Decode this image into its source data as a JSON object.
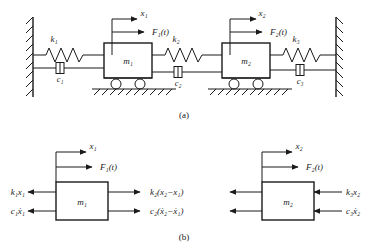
{
  "figure": {
    "title_a": "(a)",
    "title_b": "(b)",
    "stroke_color": "#1a1a1a",
    "mass_fill": "#ffffff",
    "background": "#ffffff"
  },
  "system": {
    "masses": [
      {
        "label": "m₁",
        "displacement": "x₁",
        "force": "F₁(t)"
      },
      {
        "label": "m₂",
        "displacement": "x₂",
        "force": "F₂(t)"
      }
    ],
    "springs": [
      {
        "label": "k₁"
      },
      {
        "label": "k₂"
      },
      {
        "label": "k₃"
      }
    ],
    "dampers": [
      {
        "label": "c₁"
      },
      {
        "label": "c₂"
      },
      {
        "label": "c₃"
      }
    ]
  },
  "free_body": {
    "left": {
      "mass_label": "m₁",
      "displacement": "x₁",
      "force": "F₁(t)",
      "left_spring_force": "k₁x₁",
      "left_damper_force": "c₁ẋ₁",
      "right_spring_force": "k₂(x₂−x₁)",
      "right_damper_force": "c₂(ẋ₂−ẋ₁)"
    },
    "right": {
      "mass_label": "m₂",
      "displacement": "x₂",
      "force": "F₂(t)",
      "right_spring_force": "k₃x₂",
      "right_damper_force": "c₃ẋ₂"
    }
  }
}
